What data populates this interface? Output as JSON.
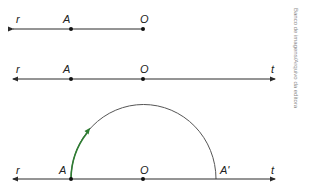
{
  "figure": {
    "credit": "Banco de imagens/Arquivo da editora",
    "colors": {
      "line": "#2a2a2a",
      "arc": "#555555",
      "highlight_arc": "#2e7d32"
    },
    "diagram_1": {
      "ray_label": "r",
      "point_a": "A",
      "point_o": "O"
    },
    "diagram_2": {
      "ray_left_label": "r",
      "ray_right_label": "t",
      "point_a": "A",
      "point_o": "O"
    },
    "diagram_3": {
      "ray_left_label": "r",
      "ray_right_label": "t",
      "point_a": "A",
      "point_o": "O",
      "point_a_prime": "A'"
    }
  }
}
